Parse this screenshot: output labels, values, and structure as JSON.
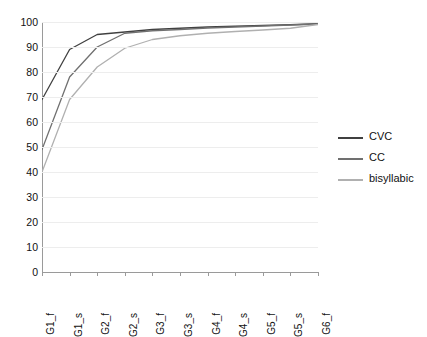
{
  "chart_data": {
    "type": "line",
    "title": "",
    "xlabel": "",
    "ylabel": "",
    "categories": [
      "G1_f",
      "G1_s",
      "G2_f",
      "G2_s",
      "G3_f",
      "G3_s",
      "G4_f",
      "G4_s",
      "G5_f",
      "G5_s",
      "G6_f"
    ],
    "ylim": [
      0,
      100
    ],
    "ytick_labels": [
      "100",
      "90",
      "80",
      "70",
      "60",
      "50",
      "40",
      "30",
      "20",
      "10",
      "0"
    ],
    "ytick_values": [
      100,
      90,
      80,
      70,
      60,
      50,
      40,
      30,
      20,
      10,
      0
    ],
    "grid": true,
    "legend_position": "right",
    "series": [
      {
        "name": "CVC",
        "color": "#404040",
        "values": [
          69,
          89,
          95,
          96,
          97,
          97.5,
          98,
          98.3,
          98.6,
          98.9,
          99.3
        ]
      },
      {
        "name": "CC",
        "color": "#707070",
        "values": [
          49,
          78,
          90,
          95.5,
          96.5,
          97,
          97.6,
          98,
          98.4,
          98.8,
          99.2
        ]
      },
      {
        "name": "bisyllabic",
        "color": "#b0b0b0",
        "values": [
          40,
          69,
          82,
          89.5,
          93,
          94.5,
          95.5,
          96.2,
          96.8,
          97.5,
          99
        ]
      }
    ]
  },
  "legend": {
    "items": [
      {
        "label": "CVC"
      },
      {
        "label": "CC"
      },
      {
        "label": "bisyllabic"
      }
    ]
  }
}
